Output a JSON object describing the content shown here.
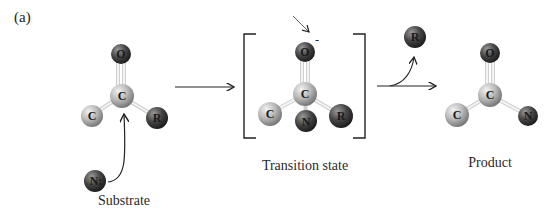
{
  "panel_label": "(a)",
  "substrate": {
    "caption": "Substrate",
    "atoms": {
      "O": "O",
      "C_center": "C",
      "C_left": "C",
      "R": "R",
      "N": "N:"
    }
  },
  "transition_state": {
    "caption": "Transition state",
    "charge": "-",
    "atoms": {
      "O": "O",
      "C_center": "C",
      "C_left": "C",
      "N": "N",
      "R": "R"
    }
  },
  "leaving_group": {
    "label": "R"
  },
  "product": {
    "caption": "Product",
    "atoms": {
      "O": "O",
      "C_center": "C",
      "C_left": "C",
      "N": "N"
    }
  },
  "colors": {
    "carbon": "#b8b8b8",
    "oxygen": "#4a4a4a",
    "r_group": "#3e3e3e",
    "nitrogen": "#3a3a3a",
    "bond": "#e8e8e8",
    "arrow": "#222222"
  }
}
